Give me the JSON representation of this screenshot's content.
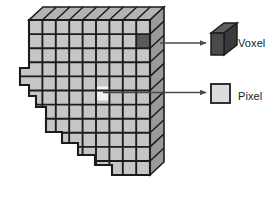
{
  "figure": {
    "background_color": "#ffffff"
  },
  "legend": {
    "items": [
      {
        "key": "voxel",
        "label": "Voxel",
        "icon": "cube-3d-icon",
        "swatch_color": "#4a4a4a",
        "swatch_top_color": "#5f5f5f",
        "swatch_side_color": "#3a3a3a",
        "points_to": "highlighted-voxel-cell"
      },
      {
        "key": "pixel",
        "label": "Pixel",
        "icon": "square-2d-icon",
        "swatch_color": "#dcdcdc",
        "points_to": "highlighted-pixel-cell"
      }
    ]
  },
  "grid": {
    "name": "voxel-slab",
    "columns": 9,
    "rows": 11,
    "cell_fill": "#c6c6c6",
    "top_face_fill": "#b3b3b3",
    "side_face_fill": "#9a9a9a",
    "line_color": "#1c1c1c",
    "highlighted_voxel": {
      "col": 8,
      "row": 1,
      "fill": "#5a5a5a"
    },
    "highlighted_pixel": {
      "col": 5,
      "row": 4,
      "fill": "#f2f2f2"
    }
  },
  "arrows": {
    "color": "#4a4a4a",
    "voxel_arrow": {
      "from_x": 160,
      "from_y": 43,
      "to_x": 206,
      "to_y": 43
    },
    "pixel_arrow": {
      "from_x": 108,
      "from_y": 92,
      "to_x": 206,
      "to_y": 92
    }
  },
  "colors": {
    "ink": "#1c1c1c",
    "paper": "#ffffff",
    "slab_light": "#c6c6c6",
    "slab_top": "#b3b3b3",
    "slab_side": "#9a9a9a",
    "voxel_dark": "#4a4a4a",
    "pixel_light": "#dcdcdc"
  }
}
